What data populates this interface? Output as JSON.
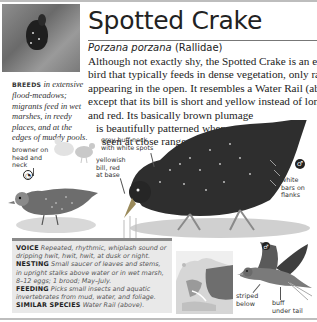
{
  "header": {
    "common_name": "Spotted Crake",
    "latin_name": "Porzana porzana",
    "family": "(Rallidae)"
  },
  "intro": {
    "lines": [
      "Although not exactly shy, the Spotted Crake is an elusive",
      "bird that typically feeds in dense vegetation, only rarely",
      "appearing in the open. It resembles a Water Rail (above),",
      "except that its bill is short and yellow instead of long",
      "and red. Its basically brown plumage",
      "is beautifully patterned when",
      "seen at close range."
    ]
  },
  "breeds": {
    "label": "BREEDS",
    "text": "in extensive flood-meadows; migrants feed in wet marshes, in reedy places, and at the edges of muddy pools."
  },
  "annotations": {
    "browner": "browner on\nhead and\nneck",
    "neck": "grey-buff neck\nwith white spots",
    "bill": "yellowish\nbill, red\nat base",
    "flanks": "white\nbars on\nflanks",
    "striped": "striped\nbelow",
    "undertail": "buff\nunder tail"
  },
  "info": {
    "voice_label": "VOICE",
    "voice_text": "Repeated, rhythmic, whiplash sound or dripping hwit, hwit, hwit, at dusk or night.",
    "nesting_label": "NESTING",
    "nesting_text": "Small saucer of leaves and stems, in upright stalks above water or in wet marsh, 8–12 eggs; 1 brood; May–July.",
    "feeding_label": "FEEDING",
    "feeding_text": "Picks small insects and aquatic invertebrates from mud, water, and foliage.",
    "similar_label": "SIMILAR SPECIES",
    "similar_text": "Water Rail (above)."
  },
  "symbols": {
    "female": "◔",
    "male": "♂"
  }
}
